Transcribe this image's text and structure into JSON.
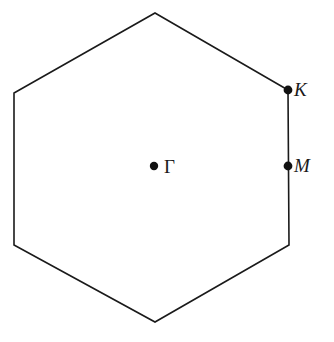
{
  "figure": {
    "type": "brillouin-zone-diagram",
    "background_color": "#ffffff",
    "line_color": "#1a1a1a",
    "line_width": 1.6,
    "dot_color": "#111111",
    "dot_radius": 4.2,
    "canvas": {
      "width": 334,
      "height": 342
    }
  },
  "chart_data": {
    "type": "diagram",
    "title": "",
    "xlabel": "",
    "ylabel": "",
    "shape": {
      "name": "hexagon",
      "sides": 6,
      "orientation": "pointy-top",
      "vertices": [
        {
          "name": "top",
          "x": 155,
          "y": 13
        },
        {
          "name": "upper-right",
          "x": 288,
          "y": 90
        },
        {
          "name": "lower-right",
          "x": 289,
          "y": 245
        },
        {
          "name": "bottom",
          "x": 155,
          "y": 322
        },
        {
          "name": "lower-left",
          "x": 14,
          "y": 245
        },
        {
          "name": "upper-left",
          "x": 14,
          "y": 93
        }
      ]
    },
    "points": [
      {
        "id": "gamma",
        "label": "Γ",
        "label_style": "upright",
        "x": 154,
        "y": 166,
        "label_x": 164,
        "label_y": 157,
        "role": "zone-center"
      },
      {
        "id": "K",
        "label": "K",
        "label_style": "italic",
        "x": 288,
        "y": 90,
        "label_x": 294,
        "label_y": 80,
        "role": "zone-corner"
      },
      {
        "id": "M",
        "label": "M",
        "label_style": "italic",
        "x": 288,
        "y": 166,
        "label_x": 294,
        "label_y": 156,
        "role": "edge-midpoint"
      }
    ],
    "grid": false,
    "legend": null,
    "annotations": []
  }
}
